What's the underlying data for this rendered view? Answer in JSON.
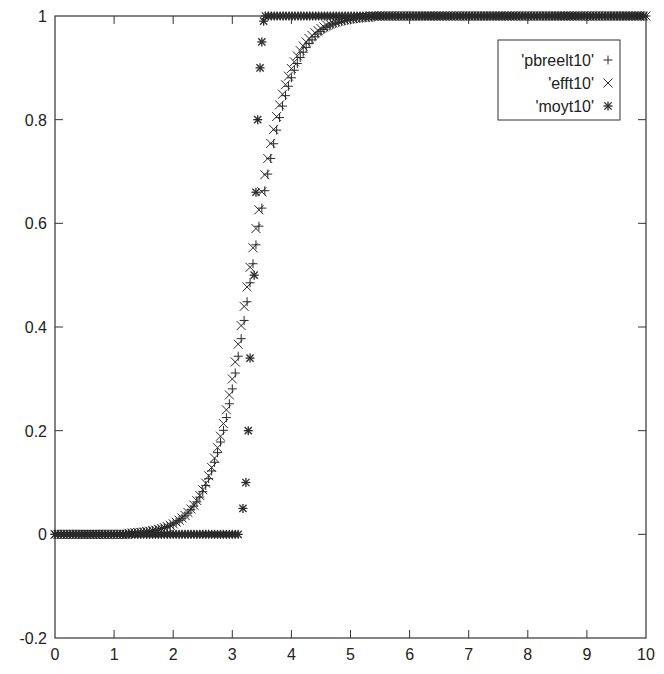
{
  "chart_data": {
    "type": "scatter",
    "title": "",
    "xlabel": "",
    "ylabel": "",
    "xlim": [
      0,
      10
    ],
    "ylim": [
      -0.2,
      1
    ],
    "x_ticks": [
      "0",
      "1",
      "2",
      "3",
      "4",
      "5",
      "6",
      "7",
      "8",
      "9",
      "10"
    ],
    "y_ticks": [
      "-0.2",
      "0",
      "0.2",
      "0.4",
      "0.6",
      "0.8",
      "1"
    ],
    "grid": false,
    "legend_position": "upper right",
    "series": [
      {
        "name": "'pbreelt10'",
        "marker": "+",
        "model": {
          "kind": "logistic",
          "center": 3.32,
          "scale": 0.34,
          "x_start": 0.0,
          "x_end": 10.0,
          "step": 0.05
        },
        "sample_points": [
          [
            0,
            0
          ],
          [
            1.8,
            0.01
          ],
          [
            2.5,
            0.09
          ],
          [
            3.0,
            0.28
          ],
          [
            3.3,
            0.48
          ],
          [
            3.6,
            0.68
          ],
          [
            4.0,
            0.86
          ],
          [
            4.5,
            0.97
          ],
          [
            5.0,
            0.99
          ],
          [
            6.0,
            1.0
          ],
          [
            10,
            1.0
          ]
        ]
      },
      {
        "name": "'efft10'",
        "marker": "x",
        "model": {
          "kind": "logistic",
          "center": 3.28,
          "scale": 0.33,
          "x_start": 0.0,
          "x_end": 10.0,
          "step": 0.05
        },
        "sample_points": [
          [
            0,
            0
          ],
          [
            1.6,
            -0.01
          ],
          [
            2.5,
            0.1
          ],
          [
            3.0,
            0.3
          ],
          [
            3.3,
            0.5
          ],
          [
            3.6,
            0.72
          ],
          [
            4.0,
            0.88
          ],
          [
            4.5,
            0.97
          ],
          [
            5.0,
            0.99
          ],
          [
            10,
            1.0
          ]
        ]
      },
      {
        "name": "'moyt10'",
        "marker": "*",
        "points": [
          [
            3.18,
            0.05
          ],
          [
            3.23,
            0.1
          ],
          [
            3.27,
            0.2
          ],
          [
            3.3,
            0.34
          ],
          [
            3.37,
            0.5
          ],
          [
            3.4,
            0.66
          ],
          [
            3.43,
            0.8
          ],
          [
            3.47,
            0.9
          ],
          [
            3.5,
            0.95
          ],
          [
            3.53,
            0.99
          ]
        ],
        "flat_low": {
          "x_start": 0.0,
          "x_end": 3.13,
          "y": 0.0,
          "step": 0.05
        },
        "flat_high": {
          "x_start": 3.56,
          "x_end": 10.0,
          "y": 1.0,
          "step": 0.05
        }
      }
    ]
  },
  "legend": {
    "items": [
      {
        "label": "'pbreelt10'",
        "marker": "+"
      },
      {
        "label": "'efft10'",
        "marker": "×"
      },
      {
        "label": "'moyt10'",
        "marker": "✱"
      }
    ]
  },
  "colors": {
    "axis": "#333333",
    "marker": "#2a2a2a",
    "background": "#ffffff"
  }
}
